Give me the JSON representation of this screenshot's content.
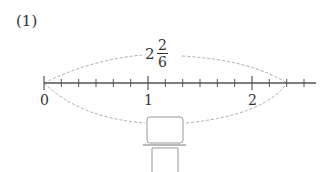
{
  "problem_label": "(1)",
  "mixed_number": {
    "whole": "2",
    "numerator": "2",
    "denominator": "6"
  },
  "number_line": {
    "labels": [
      "0",
      "1",
      "2"
    ],
    "subdivisions_per_unit": 6,
    "marked_value": "2 2/6"
  },
  "answer_box": {
    "value": ""
  },
  "colors": {
    "axis": "#555555",
    "dashed_arc": "#aaaaaa",
    "box": "#999999"
  }
}
